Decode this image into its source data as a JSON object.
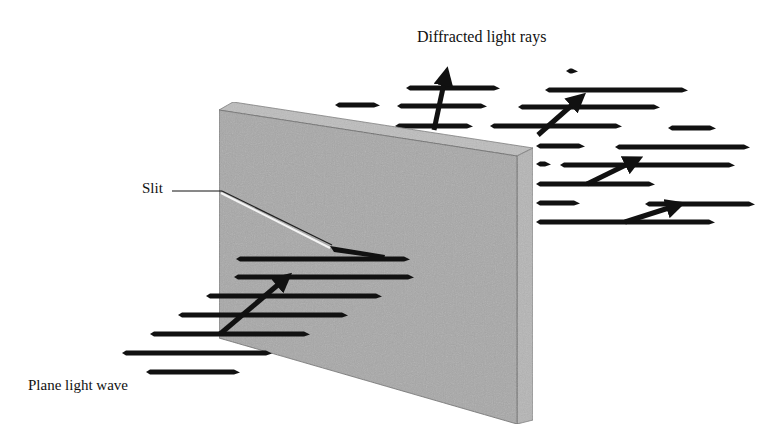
{
  "diagram": {
    "labels": {
      "diffracted": "Diffracted light rays",
      "slit": "Slit",
      "plane_wave": "Plane light wave"
    },
    "colors": {
      "background": "#ffffff",
      "barrier_front": "#a9a9a9",
      "barrier_top": "#bcbcbc",
      "barrier_side": "#b3b3b3",
      "wavefront": "#111111",
      "arrow": "#111111",
      "slit_line": "#ffffff"
    },
    "incident_wavefronts": [
      {
        "x1": 236,
        "x2": 410,
        "y": 259
      },
      {
        "x1": 234,
        "x2": 414,
        "y": 277
      },
      {
        "x1": 206,
        "x2": 382,
        "y": 296
      },
      {
        "x1": 178,
        "x2": 348,
        "y": 315
      },
      {
        "x1": 150,
        "x2": 310,
        "y": 334
      },
      {
        "x1": 122,
        "x2": 272,
        "y": 353
      },
      {
        "x1": 146,
        "x2": 240,
        "y": 372
      }
    ],
    "diffracted_wavefronts": [
      {
        "x1": 406,
        "x2": 500,
        "y": 88
      },
      {
        "x1": 545,
        "x2": 688,
        "y": 90
      },
      {
        "x1": 335,
        "x2": 380,
        "y": 105
      },
      {
        "x1": 397,
        "x2": 487,
        "y": 106
      },
      {
        "x1": 518,
        "x2": 660,
        "y": 107
      },
      {
        "x1": 395,
        "x2": 473,
        "y": 126
      },
      {
        "x1": 490,
        "x2": 622,
        "y": 126
      },
      {
        "x1": 668,
        "x2": 716,
        "y": 128
      },
      {
        "x1": 536,
        "x2": 585,
        "y": 146
      },
      {
        "x1": 615,
        "x2": 750,
        "y": 147
      },
      {
        "x1": 536,
        "x2": 551,
        "y": 164
      },
      {
        "x1": 560,
        "x2": 735,
        "y": 165
      },
      {
        "x1": 536,
        "x2": 655,
        "y": 184
      },
      {
        "x1": 536,
        "x2": 580,
        "y": 203
      },
      {
        "x1": 645,
        "x2": 755,
        "y": 204
      },
      {
        "x1": 536,
        "x2": 715,
        "y": 222
      },
      {
        "x1": 566,
        "x2": 578,
        "y": 71
      }
    ],
    "arrows": [
      {
        "name": "incident-arrow",
        "x1": 220,
        "y1": 334,
        "x2": 286,
        "y2": 278
      },
      {
        "name": "diffracted-arrow-up",
        "x1": 434,
        "y1": 130,
        "x2": 446,
        "y2": 74
      },
      {
        "name": "diffracted-arrow-diag-1",
        "x1": 538,
        "y1": 135,
        "x2": 580,
        "y2": 98
      },
      {
        "name": "diffracted-arrow-diag-2",
        "x1": 587,
        "y1": 184,
        "x2": 636,
        "y2": 160
      },
      {
        "name": "diffracted-arrow-diag-3",
        "x1": 625,
        "y1": 222,
        "x2": 678,
        "y2": 205
      }
    ]
  }
}
